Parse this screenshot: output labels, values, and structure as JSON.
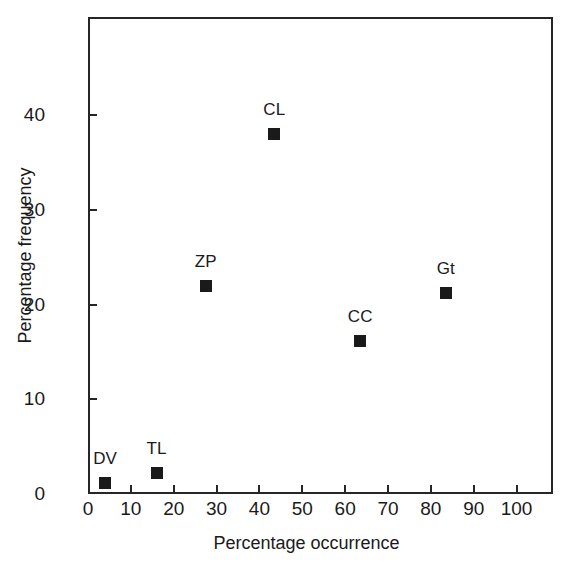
{
  "chart_data": {
    "type": "scatter",
    "title": "",
    "xlabel": "Percentage occurrence",
    "ylabel": "Percentage frequency",
    "xlim": [
      0,
      108.5
    ],
    "ylim": [
      0,
      50.4
    ],
    "grid": false,
    "legend": "none",
    "marker_style": "filled-square",
    "marker_color": "#1a1a1a",
    "xticks": [
      0,
      10,
      20,
      30,
      40,
      50,
      60,
      70,
      80,
      90,
      100
    ],
    "xticklabels": [
      "0",
      "10",
      "20",
      "30",
      "40",
      "50",
      "60",
      "70",
      "80",
      "90",
      "100"
    ],
    "yticks": [
      0,
      10,
      20,
      30,
      40
    ],
    "yticklabels": [
      "0",
      "10",
      "20",
      "30",
      "40"
    ],
    "points": [
      {
        "label": "DV",
        "x": 4,
        "y": 1.2
      },
      {
        "label": "TL",
        "x": 16,
        "y": 2.2
      },
      {
        "label": "ZP",
        "x": 27.5,
        "y": 22
      },
      {
        "label": "CL",
        "x": 43.5,
        "y": 38
      },
      {
        "label": "CC",
        "x": 63.5,
        "y": 16.2
      },
      {
        "label": "Gt",
        "x": 83.5,
        "y": 21.2
      }
    ]
  }
}
